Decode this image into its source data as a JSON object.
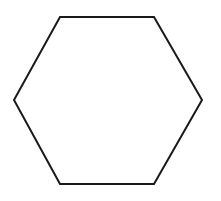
{
  "figure": {
    "shape": "regular-hexagon",
    "orientation": "flat-top",
    "stroke_color": "#1a1a1a",
    "fill_color": "#ffffff",
    "background": "#ffffff",
    "vertices": [
      [
        60,
        17
      ],
      [
        154,
        17
      ],
      [
        202,
        100
      ],
      [
        154,
        184
      ],
      [
        60,
        184
      ],
      [
        14,
        100
      ]
    ]
  }
}
